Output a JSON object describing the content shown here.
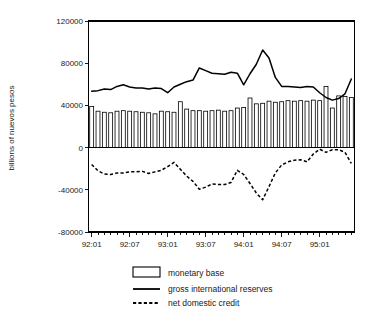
{
  "chart_data": {
    "type": "bar",
    "title": "",
    "subtitle": "",
    "xlabel": "",
    "ylabel": "billions of nuevos pesos",
    "ylim": [
      -80000,
      120000
    ],
    "yticks": [
      120000,
      80000,
      40000,
      0,
      -40000,
      -80000
    ],
    "ytick_labels": [
      "120000",
      "80000",
      "40000",
      "0",
      "-40000",
      "-80000"
    ],
    "grid": false,
    "legend_position": "bottom-center",
    "x": [
      "92:01",
      "92:02",
      "92:03",
      "92:04",
      "92:05",
      "92:06",
      "92:07",
      "92:08",
      "92:09",
      "92:10",
      "92:11",
      "92:12",
      "93:01",
      "93:02",
      "93:03",
      "93:04",
      "93:05",
      "93:06",
      "93:07",
      "93:08",
      "93:09",
      "93:10",
      "93:11",
      "93:12",
      "94:01",
      "94:02",
      "94:03",
      "94:04",
      "94:05",
      "94:06",
      "94:07",
      "94:08",
      "94:09",
      "94:10",
      "94:11",
      "94:12",
      "95:01",
      "95:02",
      "95:03",
      "95:04",
      "95:05",
      "95:06"
    ],
    "xtick_labels": [
      "92:01",
      "92:07",
      "93:01",
      "93:07",
      "94:01",
      "94:07",
      "95:01"
    ],
    "xtick_label_positions": [
      "92:01",
      "92:07",
      "93:01",
      "93:07",
      "94:01",
      "94:07",
      "95:01"
    ],
    "xtick_interval_months": 1,
    "series": [
      {
        "name": "monetary base",
        "type": "bar",
        "values": [
          39000,
          34500,
          33500,
          33000,
          34500,
          35000,
          34500,
          34000,
          33500,
          33000,
          32000,
          34500,
          34000,
          33500,
          43500,
          36500,
          35000,
          35000,
          34500,
          35000,
          35500,
          34500,
          35000,
          37500,
          38000,
          47000,
          41500,
          42000,
          44000,
          43000,
          43500,
          44500,
          44000,
          44500,
          44000,
          45000,
          44500,
          58000,
          37500,
          49000,
          48500,
          47500
        ]
      },
      {
        "name": "gross international reserves",
        "type": "line",
        "style": "solid",
        "values": [
          53500,
          54000,
          55500,
          55000,
          58000,
          59500,
          57500,
          56500,
          56500,
          55500,
          56500,
          56000,
          52000,
          57500,
          60000,
          62500,
          64000,
          75500,
          73000,
          70500,
          70000,
          69500,
          71500,
          70500,
          59500,
          70000,
          79000,
          92500,
          85000,
          66500,
          58000,
          58000,
          57500,
          57000,
          58000,
          57500,
          52000,
          47500,
          45000,
          46500,
          51000,
          65000
        ]
      },
      {
        "name": "net domestic credit",
        "type": "line",
        "style": "dashed",
        "values": [
          -16000,
          -22000,
          -25000,
          -25500,
          -24000,
          -24000,
          -23000,
          -23000,
          -22500,
          -24500,
          -23000,
          -21500,
          -18000,
          -14000,
          -20500,
          -27000,
          -32000,
          -39500,
          -37500,
          -34500,
          -35000,
          -35000,
          -33000,
          -21500,
          -25500,
          -34000,
          -43000,
          -49500,
          -37000,
          -24000,
          -16500,
          -13500,
          -12000,
          -11500,
          -13500,
          -6000,
          -1500,
          -4500,
          -2000,
          -2000,
          -4500,
          -15000
        ]
      }
    ],
    "legend": [
      {
        "label": "monetary base",
        "marker": "bar-swatch"
      },
      {
        "label": "gross international reserves",
        "marker": "solid-line"
      },
      {
        "label": "net domestic credit",
        "marker": "dashed-line"
      }
    ]
  }
}
